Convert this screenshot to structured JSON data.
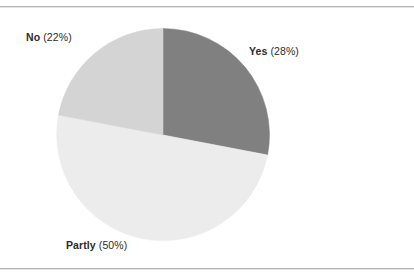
{
  "chart_data": {
    "type": "pie",
    "title": "",
    "categories": [
      "Yes",
      "Partly",
      "No"
    ],
    "values": [
      28,
      50,
      22
    ],
    "value_unit": "%",
    "legend_position": "none",
    "labels_position": "outside",
    "start_angle_deg": 0,
    "direction": "clockwise",
    "slices": [
      {
        "name": "Yes",
        "percent": 28,
        "label": "Yes (28%)",
        "color": "#808080"
      },
      {
        "name": "Partly",
        "percent": 50,
        "label": "Partly (50%)",
        "color": "#ececec"
      },
      {
        "name": "No",
        "percent": 22,
        "label": "No (22%)",
        "color": "#d4d4d4"
      }
    ]
  },
  "labels": {
    "yes": {
      "category": "Yes",
      "percent": "(28%)"
    },
    "partly": {
      "category": "Partly",
      "percent": "(50%)"
    },
    "no": {
      "category": "No",
      "percent": "(22%)"
    }
  },
  "colors": {
    "background": "#ffffff",
    "rule": "#b6b6b6",
    "text": "#2b2b2b",
    "yes_slice": "#808080",
    "partly_slice": "#ececec",
    "no_slice": "#d4d4d4"
  }
}
